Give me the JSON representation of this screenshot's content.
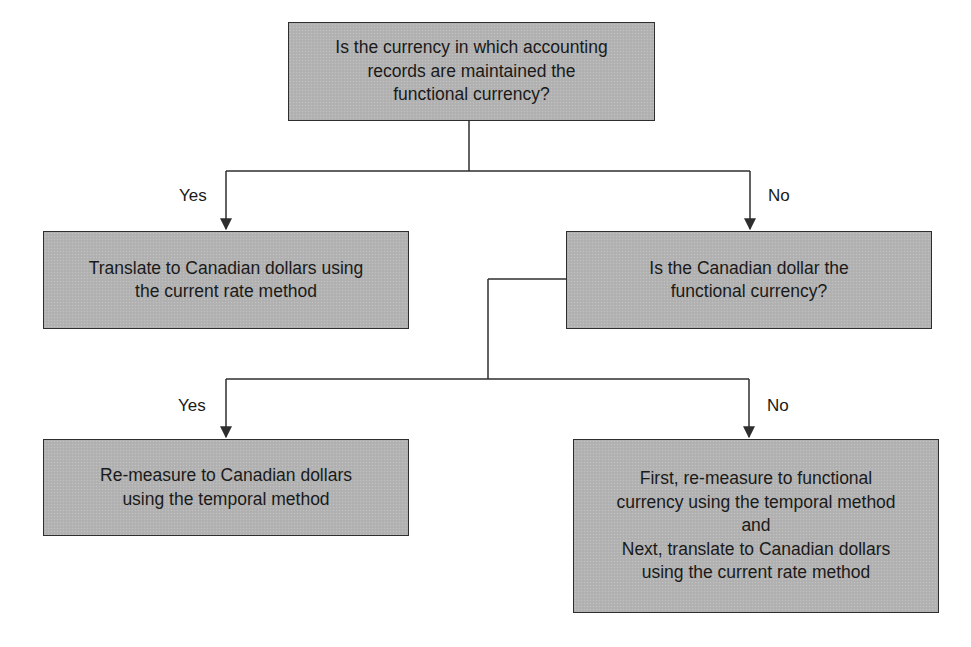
{
  "diagram": {
    "type": "decision-flowchart",
    "nodes": {
      "q1": {
        "kind": "decision",
        "lines": [
          "Is the currency in which accounting",
          "records are maintained the",
          "functional currency?"
        ]
      },
      "a1_yes": {
        "kind": "outcome",
        "lines": [
          "Translate to Canadian dollars using",
          "the current rate method"
        ]
      },
      "q2": {
        "kind": "decision",
        "lines": [
          "Is the Canadian dollar the",
          "functional currency?"
        ]
      },
      "a2_yes": {
        "kind": "outcome",
        "lines": [
          "Re-measure to Canadian dollars",
          "using the temporal method"
        ]
      },
      "a2_no": {
        "kind": "outcome",
        "lines": [
          "First, re-measure to functional",
          "currency using the temporal method",
          "and",
          "Next, translate to Canadian dollars",
          "using the current rate method"
        ]
      }
    },
    "edges": [
      {
        "from": "q1",
        "to": "a1_yes",
        "label": "Yes"
      },
      {
        "from": "q1",
        "to": "q2",
        "label": "No"
      },
      {
        "from": "q2",
        "to": "a2_yes",
        "label": "Yes"
      },
      {
        "from": "q2",
        "to": "a2_no",
        "label": "No"
      }
    ],
    "colors": {
      "box_fill": "#b3b3b3",
      "box_border": "#2e2e2e",
      "line": "#2e2e2e",
      "text": "#1a1a1a",
      "background": "#ffffff"
    }
  }
}
